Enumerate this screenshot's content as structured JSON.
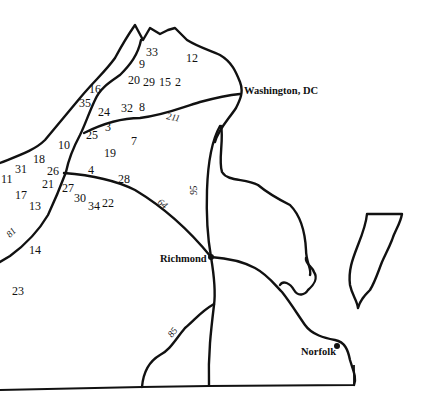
{
  "map": {
    "cities": [
      {
        "name": "Washington, DC",
        "x": 244,
        "y": 94
      },
      {
        "name": "Richmond",
        "x": 160,
        "y": 262
      },
      {
        "name": "Norfolk",
        "x": 301,
        "y": 355
      }
    ],
    "routes": [
      {
        "label": "211",
        "x": 166,
        "y": 119,
        "rotate": 12
      },
      {
        "label": "95",
        "x": 197,
        "y": 190,
        "rotate": -90
      },
      {
        "label": "64",
        "x": 159,
        "y": 205,
        "rotate": 40
      },
      {
        "label": "81",
        "x": 12,
        "y": 236,
        "rotate": -45
      },
      {
        "label": "85",
        "x": 174,
        "y": 335,
        "rotate": -52
      }
    ],
    "site_numbers": [
      {
        "label": "33",
        "x": 146,
        "y": 56
      },
      {
        "label": "12",
        "x": 186,
        "y": 62
      },
      {
        "label": "9",
        "x": 139,
        "y": 68
      },
      {
        "label": "20",
        "x": 128,
        "y": 84
      },
      {
        "label": "29",
        "x": 143,
        "y": 86
      },
      {
        "label": "15",
        "x": 159,
        "y": 86
      },
      {
        "label": "2",
        "x": 175,
        "y": 86
      },
      {
        "label": "16",
        "x": 89,
        "y": 93
      },
      {
        "label": "35",
        "x": 79,
        "y": 107
      },
      {
        "label": "24",
        "x": 98,
        "y": 116
      },
      {
        "label": "32",
        "x": 121,
        "y": 112
      },
      {
        "label": "8",
        "x": 139,
        "y": 111
      },
      {
        "label": "3",
        "x": 105,
        "y": 131
      },
      {
        "label": "25",
        "x": 86,
        "y": 139
      },
      {
        "label": "7",
        "x": 131,
        "y": 145
      },
      {
        "label": "10",
        "x": 58,
        "y": 149
      },
      {
        "label": "19",
        "x": 104,
        "y": 157
      },
      {
        "label": "18",
        "x": 33,
        "y": 163
      },
      {
        "label": "31",
        "x": 15,
        "y": 173
      },
      {
        "label": "26",
        "x": 47,
        "y": 175
      },
      {
        "label": "4",
        "x": 88,
        "y": 174
      },
      {
        "label": "11",
        "x": 1,
        "y": 183
      },
      {
        "label": "28",
        "x": 118,
        "y": 183
      },
      {
        "label": "21",
        "x": 42,
        "y": 188
      },
      {
        "label": "27",
        "x": 62,
        "y": 192
      },
      {
        "label": "17",
        "x": 15,
        "y": 199
      },
      {
        "label": "30",
        "x": 74,
        "y": 202
      },
      {
        "label": "22",
        "x": 102,
        "y": 207
      },
      {
        "label": "34",
        "x": 88,
        "y": 210
      },
      {
        "label": "13",
        "x": 29,
        "y": 210
      },
      {
        "label": "14",
        "x": 29,
        "y": 254
      },
      {
        "label": "23",
        "x": 12,
        "y": 295
      }
    ]
  },
  "colors": {
    "ink": "#111111",
    "background": "#ffffff"
  }
}
